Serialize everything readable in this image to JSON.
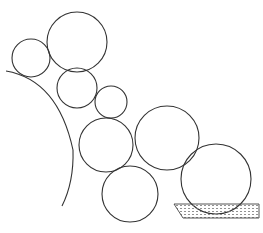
{
  "diagram": {
    "colors": {
      "stroke": "#333333",
      "background": "#ffffff",
      "hatch": "#777777"
    },
    "circles": [
      {
        "id": "top-large",
        "cx": 77,
        "cy": 42,
        "r": 30
      },
      {
        "id": "left-small",
        "cx": 31,
        "cy": 58,
        "r": 19
      },
      {
        "id": "middle",
        "cx": 77,
        "cy": 88,
        "r": 20
      },
      {
        "id": "small-right",
        "cx": 111,
        "cy": 102,
        "r": 16
      },
      {
        "id": "center-left",
        "cx": 106,
        "cy": 145,
        "r": 27
      },
      {
        "id": "right",
        "cx": 167,
        "cy": 138,
        "r": 32
      },
      {
        "id": "bottom",
        "cx": 130,
        "cy": 194,
        "r": 28
      },
      {
        "id": "far-right",
        "cx": 216,
        "cy": 179,
        "r": 35
      }
    ],
    "arc": {
      "path": "M 6 71 Q 58 80 73 150 Q 74 182 62 206"
    },
    "tray": {
      "points": "174,204 259,204 259,218 183,218"
    },
    "caption": ""
  }
}
